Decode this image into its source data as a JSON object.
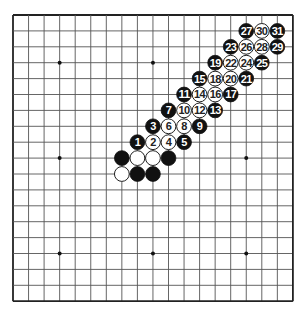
{
  "board": {
    "size": 19,
    "origin_x": 13,
    "origin_y": 15,
    "spacing_x": 15.55,
    "spacing_y": 15.9,
    "line_color": "#555555",
    "border_color": "#222222",
    "background": "#ffffff",
    "star_points": [
      [
        3,
        3
      ],
      [
        9,
        3
      ],
      [
        15,
        3
      ],
      [
        3,
        9
      ],
      [
        9,
        9
      ],
      [
        15,
        9
      ],
      [
        3,
        15
      ],
      [
        9,
        15
      ],
      [
        15,
        15
      ]
    ]
  },
  "colors": {
    "black_stone": "#111111",
    "white_stone": "#ffffff",
    "white_stone_border": "#222222",
    "black_label": "#ffffff",
    "white_label": "#222222"
  },
  "stones": [
    {
      "col": 7,
      "row": 9,
      "color": "black",
      "label": ""
    },
    {
      "col": 8,
      "row": 9,
      "color": "white",
      "label": ""
    },
    {
      "col": 9,
      "row": 9,
      "color": "white",
      "label": ""
    },
    {
      "col": 10,
      "row": 9,
      "color": "black",
      "label": ""
    },
    {
      "col": 7,
      "row": 10,
      "color": "white",
      "label": ""
    },
    {
      "col": 8,
      "row": 10,
      "color": "black",
      "label": ""
    },
    {
      "col": 9,
      "row": 10,
      "color": "black",
      "label": ""
    },
    {
      "col": 8,
      "row": 8,
      "color": "black",
      "label": "1"
    },
    {
      "col": 9,
      "row": 8,
      "color": "white",
      "label": "2"
    },
    {
      "col": 9,
      "row": 7,
      "color": "black",
      "label": "3"
    },
    {
      "col": 10,
      "row": 8,
      "color": "white",
      "label": "4"
    },
    {
      "col": 11,
      "row": 8,
      "color": "black",
      "label": "5"
    },
    {
      "col": 10,
      "row": 7,
      "color": "white",
      "label": "6"
    },
    {
      "col": 10,
      "row": 6,
      "color": "black",
      "label": "7"
    },
    {
      "col": 11,
      "row": 7,
      "color": "white",
      "label": "8"
    },
    {
      "col": 12,
      "row": 7,
      "color": "black",
      "label": "9"
    },
    {
      "col": 11,
      "row": 6,
      "color": "white",
      "label": "10"
    },
    {
      "col": 11,
      "row": 5,
      "color": "black",
      "label": "11"
    },
    {
      "col": 12,
      "row": 6,
      "color": "white",
      "label": "12"
    },
    {
      "col": 13,
      "row": 6,
      "color": "black",
      "label": "13"
    },
    {
      "col": 12,
      "row": 5,
      "color": "white",
      "label": "14"
    },
    {
      "col": 12,
      "row": 4,
      "color": "black",
      "label": "15"
    },
    {
      "col": 13,
      "row": 5,
      "color": "white",
      "label": "16"
    },
    {
      "col": 14,
      "row": 5,
      "color": "black",
      "label": "17"
    },
    {
      "col": 13,
      "row": 4,
      "color": "white",
      "label": "18"
    },
    {
      "col": 13,
      "row": 3,
      "color": "black",
      "label": "19"
    },
    {
      "col": 14,
      "row": 4,
      "color": "white",
      "label": "20"
    },
    {
      "col": 15,
      "row": 4,
      "color": "black",
      "label": "21"
    },
    {
      "col": 14,
      "row": 3,
      "color": "white",
      "label": "22"
    },
    {
      "col": 14,
      "row": 2,
      "color": "black",
      "label": "23"
    },
    {
      "col": 15,
      "row": 3,
      "color": "white",
      "label": "24"
    },
    {
      "col": 16,
      "row": 3,
      "color": "black",
      "label": "25"
    },
    {
      "col": 15,
      "row": 2,
      "color": "white",
      "label": "26"
    },
    {
      "col": 15,
      "row": 1,
      "color": "black",
      "label": "27"
    },
    {
      "col": 16,
      "row": 2,
      "color": "white",
      "label": "28"
    },
    {
      "col": 17,
      "row": 2,
      "color": "black",
      "label": "29"
    },
    {
      "col": 16,
      "row": 1,
      "color": "white",
      "label": "30"
    },
    {
      "col": 17,
      "row": 1,
      "color": "black",
      "label": "31"
    }
  ]
}
